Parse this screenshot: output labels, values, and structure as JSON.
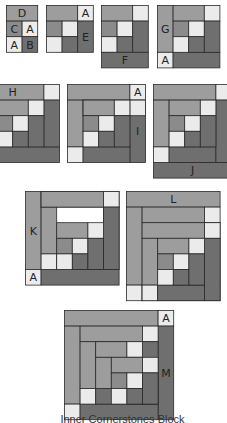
{
  "title": "Inner Cornerstones Block",
  "colors": {
    "light": "#ebebeb",
    "medium_light": "#9d9d9d",
    "medium": "#8b8b8b",
    "dark": "#6f6f6f",
    "outline": "#2a2a2a"
  },
  "blocks": [
    {
      "id": "step-1",
      "labels": [
        "D",
        "C",
        "A",
        "A",
        "B"
      ]
    },
    {
      "id": "step-2",
      "labels": [
        "A",
        "E"
      ]
    },
    {
      "id": "step-3",
      "labels": [
        "F"
      ]
    },
    {
      "id": "step-4",
      "labels": [
        "G",
        "A"
      ]
    },
    {
      "id": "step-5",
      "labels": [
        "H"
      ]
    },
    {
      "id": "step-6",
      "labels": [
        "A",
        "I"
      ]
    },
    {
      "id": "step-7",
      "labels": [
        "J"
      ]
    },
    {
      "id": "step-8",
      "labels": [
        "K",
        "A"
      ]
    },
    {
      "id": "step-9",
      "labels": [
        "L"
      ]
    },
    {
      "id": "step-10",
      "labels": [
        "A",
        "M"
      ]
    }
  ]
}
